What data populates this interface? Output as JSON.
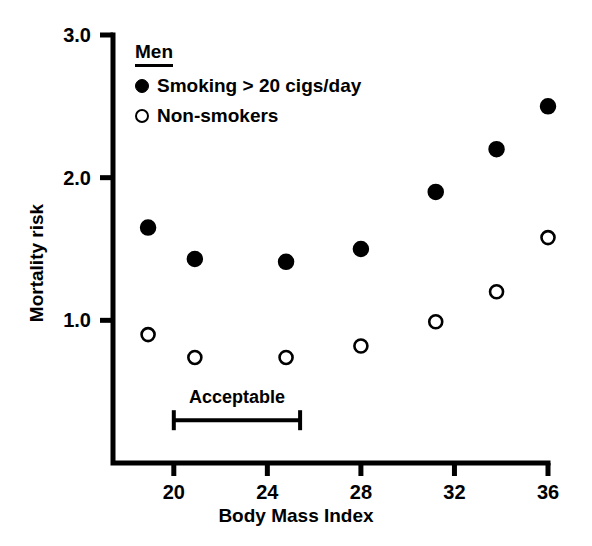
{
  "chart_data": {
    "type": "scatter",
    "title": "",
    "xlabel": "Body Mass Index",
    "ylabel": "Mortality risk",
    "xlim": [
      17.4,
      36.0
    ],
    "ylim": [
      0.0,
      3.0
    ],
    "xticks": [
      20,
      24,
      28,
      32,
      36
    ],
    "xticklabels": [
      "20",
      "24",
      "28",
      "32",
      "36"
    ],
    "yticks": [
      1.0,
      2.0,
      3.0
    ],
    "yticklabels": [
      "1.0",
      "2.0",
      "3.0"
    ],
    "grid": false,
    "legend_position": "upper-left-inside",
    "legend_title": "Men",
    "series": [
      {
        "name": "Smoking > 20 cigs/day",
        "marker": "filled-circle",
        "color": "#000000",
        "x": [
          18.9,
          20.9,
          24.8,
          28.0,
          31.2,
          33.8,
          36.0
        ],
        "values": [
          1.65,
          1.43,
          1.41,
          1.5,
          1.9,
          2.2,
          2.5
        ]
      },
      {
        "name": "Non-smokers",
        "marker": "open-circle",
        "color": "#000000",
        "x": [
          18.9,
          20.9,
          24.8,
          28.0,
          31.2,
          33.8,
          36.0
        ],
        "values": [
          0.9,
          0.74,
          0.74,
          0.82,
          0.99,
          1.2,
          1.58
        ]
      }
    ],
    "annotations": [
      {
        "name": "acceptable-range",
        "label": "Acceptable",
        "type": "range-bracket",
        "x_start": 20.0,
        "x_end": 25.4,
        "y": 0.3
      }
    ]
  },
  "axes": {
    "x_title": "Body Mass Index",
    "y_title": "Mortality risk"
  },
  "legend": {
    "title": "Men",
    "entries": [
      {
        "label": "Smoking > 20 cigs/day",
        "marker": "filled-circle"
      },
      {
        "label": "Non-smokers",
        "marker": "open-circle"
      }
    ]
  },
  "annotation": {
    "acceptable_label": "Acceptable"
  },
  "style": {
    "axis_color": "#000000",
    "marker_color": "#000000",
    "background": "#ffffff"
  }
}
